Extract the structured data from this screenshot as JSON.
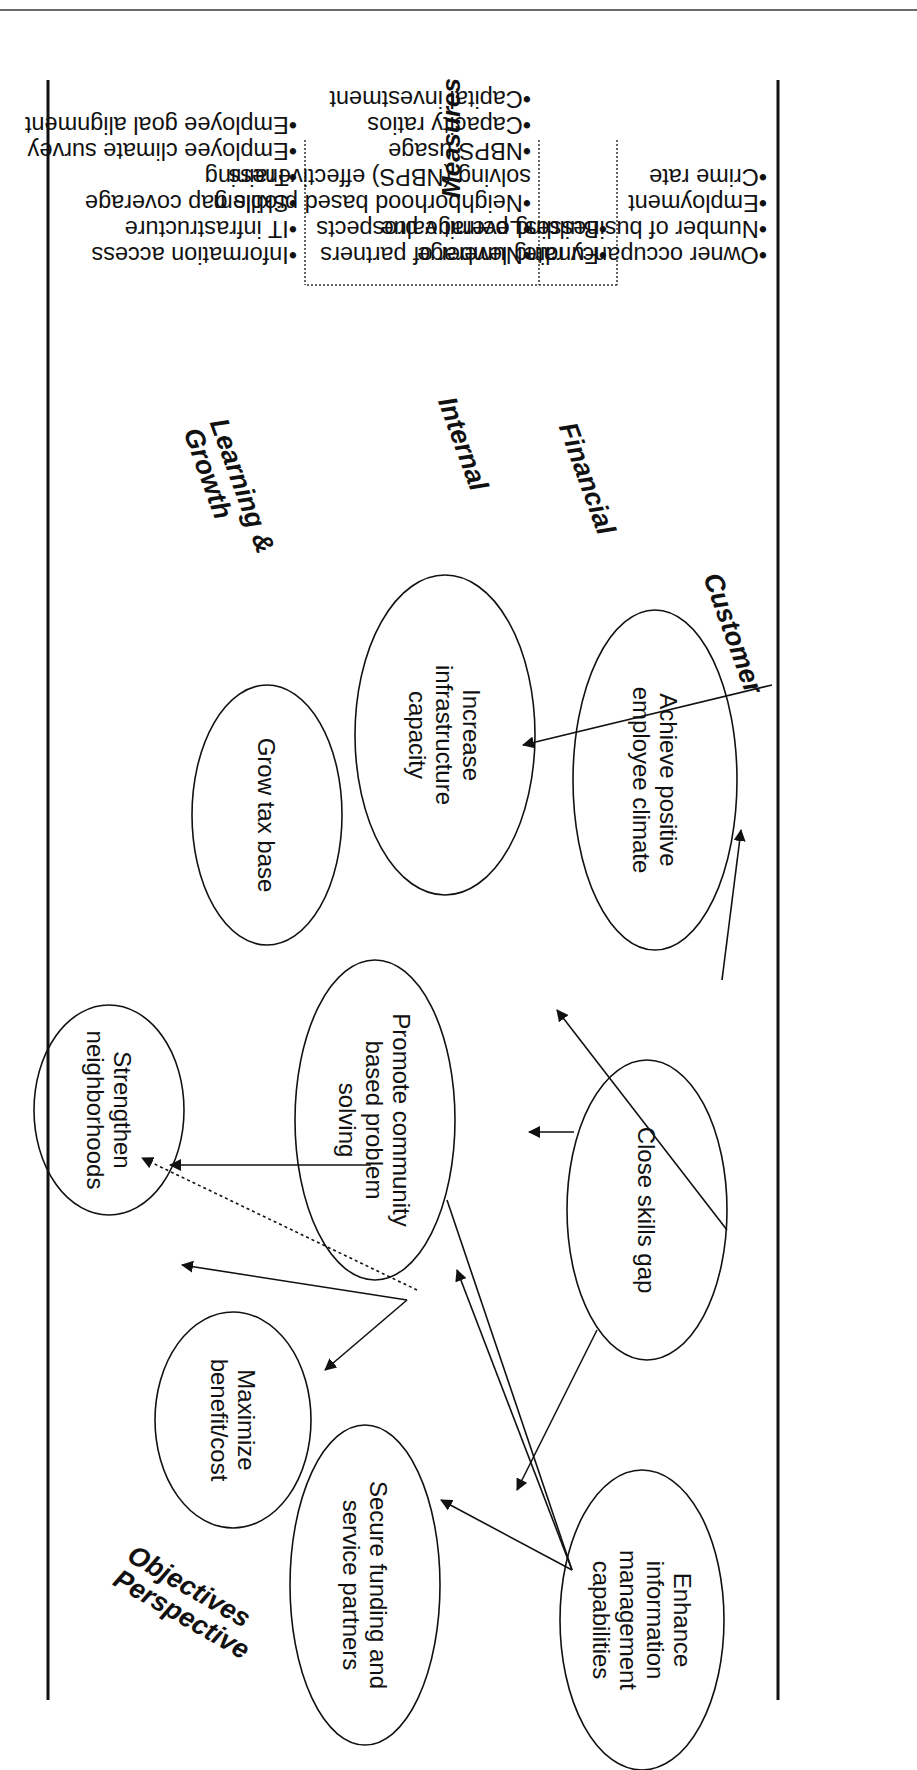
{
  "diagram": {
    "title_measures": "Measures",
    "header_objectives": "Objectives",
    "header_perspective": "Perspective",
    "perspectives": [
      {
        "name": "Customer",
        "measures": [
          "Owner occupancy rate",
          "Number of businesses",
          "Employment",
          "Crime rate"
        ]
      },
      {
        "name": "Financial",
        "measures": [
          "Funding leverage",
          "Building permit value"
        ]
      },
      {
        "name": "Internal",
        "measures": [
          "Number of partners",
          "Leverage prospects",
          "Neighborhood based problem solving (NBPS) effectiveness",
          "NBPS usage",
          "Capacity ratios",
          "Capital investment"
        ]
      },
      {
        "name_line1": "Learning &",
        "name_line2": "Growth",
        "measures": [
          "Information access",
          "IT infrastructure",
          "Skills gap coverage",
          "Training",
          "Employee climate survey",
          "Employee goal alignment"
        ]
      }
    ],
    "objectives": {
      "strengthen_neighborhoods": "Strengthen neighborhoods",
      "maximize_benefit_cost": "Maximize benefit/cost",
      "grow_tax_base": "Grow tax base",
      "secure_funding": "Secure funding and service partners",
      "promote_cbps": "Promote community based problem solving",
      "increase_infrastructure": "Increase infrastructure capacity",
      "enhance_info_mgmt": "Enhance information management capabilities",
      "close_skills_gap": "Close skills gap",
      "achieve_climate": "Achieve positive employee climate"
    },
    "colors": {
      "ink": "#111111",
      "rule": "#6b6b6b"
    }
  }
}
